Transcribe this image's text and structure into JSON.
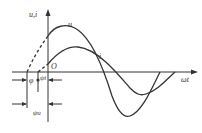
{
  "diagram": {
    "title": "",
    "axes": {
      "y_label": "u,i",
      "x_label": "ωt",
      "origin_label": "O"
    },
    "curves": [
      {
        "name": "u",
        "label": "u",
        "description": "voltage sinusoid, larger amplitude, leading"
      },
      {
        "name": "i",
        "label": "i",
        "description": "current sinusoid, smaller amplitude, lagging"
      }
    ],
    "angle_labels": {
      "phi": "φ",
      "psi_i": "ψi",
      "psi_u": "ψu"
    }
  }
}
